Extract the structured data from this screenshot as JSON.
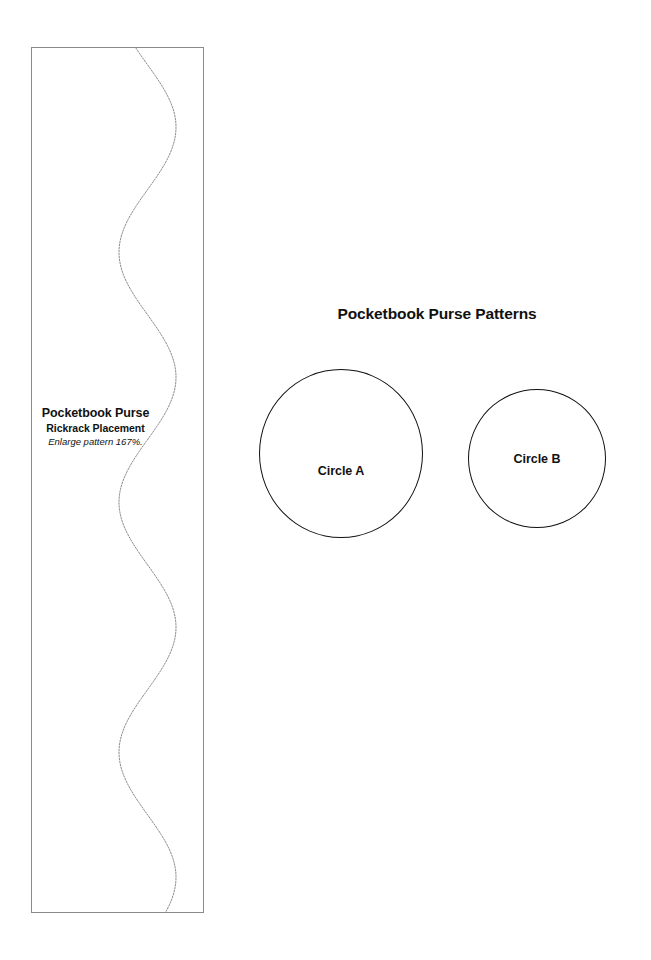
{
  "page": {
    "width": 651,
    "height": 960,
    "background_color": "#ffffff"
  },
  "rickrack_strip": {
    "name": "Pocketbook Purse Rickrack Placement guide strip",
    "border_color": "#8a8a8a",
    "label": {
      "line1": "Pocketbook Purse",
      "line2": "Rickrack Placement",
      "line3": "Enlarge pattern 167%."
    },
    "wave": {
      "name": "rickrack-wave-guide",
      "style": "dotted",
      "color": "#8c8c94",
      "description": "Vertical sinusoidal rickrack placement line",
      "amplitude_px": 28.5,
      "period_px": 250,
      "center_x_px": 116.5,
      "left_extreme_px": 88,
      "right_extreme_px": 145
    }
  },
  "patterns": {
    "title": "Pocketbook Purse Patterns",
    "circles": [
      {
        "id": "circle-a",
        "label": "Circle A",
        "diameter_px": 164,
        "stroke_color": "#111111"
      },
      {
        "id": "circle-b",
        "label": "Circle B",
        "diameter_px": 138,
        "stroke_color": "#111111"
      }
    ]
  }
}
